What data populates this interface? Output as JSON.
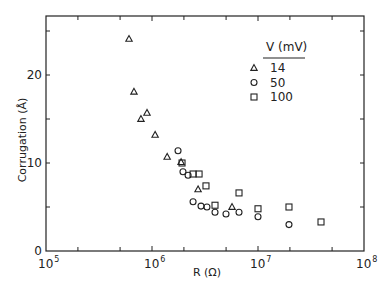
{
  "chart_data": {
    "type": "scatter",
    "title": "",
    "xlabel": "R (Ω)",
    "ylabel": "Corrugation (Å)",
    "xscale": "log",
    "xlim": [
      100000,
      100000000
    ],
    "ylim": [
      0,
      26
    ],
    "x_ticks": [
      {
        "value": 100000,
        "base": "10",
        "exp": "5"
      },
      {
        "value": 1000000,
        "base": "10",
        "exp": "6"
      },
      {
        "value": 10000000,
        "base": "10",
        "exp": "7"
      },
      {
        "value": 100000000,
        "base": "10",
        "exp": "8"
      }
    ],
    "y_ticks": [
      {
        "value": 0,
        "label": "0"
      },
      {
        "value": 10,
        "label": "10"
      },
      {
        "value": 20,
        "label": "20"
      }
    ],
    "y_minor_ticks": [
      5,
      15,
      25
    ],
    "grid": false,
    "legend": {
      "title": "V  (mV)",
      "position": "upper right",
      "entries": [
        {
          "marker": "triangle",
          "label": "14"
        },
        {
          "marker": "circle",
          "label": "50"
        },
        {
          "marker": "square",
          "label": "100"
        }
      ]
    },
    "series": [
      {
        "name": "14",
        "marker": "triangle",
        "points": [
          {
            "x": 607000,
            "y": 24.1
          },
          {
            "x": 676000,
            "y": 18.1
          },
          {
            "x": 787000,
            "y": 15.0
          },
          {
            "x": 897000,
            "y": 15.7
          },
          {
            "x": 1070000,
            "y": 13.2
          },
          {
            "x": 1390000,
            "y": 10.7
          },
          {
            "x": 1880000,
            "y": 10.1
          },
          {
            "x": 2720000,
            "y": 7.0
          },
          {
            "x": 5690000,
            "y": 5.0
          }
        ]
      },
      {
        "name": "50",
        "marker": "circle",
        "points": [
          {
            "x": 1760000,
            "y": 11.4
          },
          {
            "x": 1960000,
            "y": 9.0
          },
          {
            "x": 2190000,
            "y": 8.6
          },
          {
            "x": 2440000,
            "y": 5.6
          },
          {
            "x": 2900000,
            "y": 5.1
          },
          {
            "x": 3300000,
            "y": 5.0
          },
          {
            "x": 3930000,
            "y": 4.4
          },
          {
            "x": 4990000,
            "y": 4.2
          },
          {
            "x": 6620000,
            "y": 4.4
          },
          {
            "x": 10000000,
            "y": 3.9
          },
          {
            "x": 19600000,
            "y": 3.0
          }
        ]
      },
      {
        "name": "100",
        "marker": "square",
        "points": [
          {
            "x": 1920000,
            "y": 10.0
          },
          {
            "x": 2440000,
            "y": 8.75
          },
          {
            "x": 2780000,
            "y": 8.75
          },
          {
            "x": 3230000,
            "y": 7.4
          },
          {
            "x": 3930000,
            "y": 5.2
          },
          {
            "x": 6620000,
            "y": 6.6
          },
          {
            "x": 10000000,
            "y": 4.8
          },
          {
            "x": 19600000,
            "y": 5.0
          },
          {
            "x": 39300000,
            "y": 3.3
          }
        ]
      }
    ]
  }
}
